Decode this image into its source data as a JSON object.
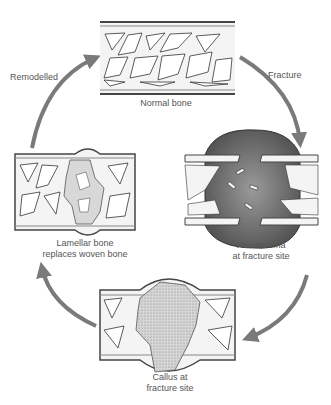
{
  "diagram": {
    "stages": [
      {
        "id": "normal",
        "label": "Normal bone"
      },
      {
        "id": "haematoma",
        "label_line1": "Haematoma",
        "label_line2": "at fracture site"
      },
      {
        "id": "callus",
        "label_line1": "Callus at",
        "label_line2": "fracture site"
      },
      {
        "id": "lamellar",
        "label_line1": "Lamellar bone",
        "label_line2": "replaces woven bone"
      }
    ],
    "arrows": [
      {
        "id": "fracture",
        "label": "Fracture",
        "from": "normal",
        "to": "haematoma"
      },
      {
        "id": "to-callus",
        "label": "",
        "from": "haematoma",
        "to": "callus"
      },
      {
        "id": "to-lamellar",
        "label": "",
        "from": "callus",
        "to": "lamellar"
      },
      {
        "id": "remodelled",
        "label": "Remodelled",
        "from": "lamellar",
        "to": "normal"
      }
    ],
    "colors": {
      "arrow": "#7a7a7a",
      "outline": "#333333",
      "bone_fill": "#f2f2f2",
      "haematoma": "#6e6e6e",
      "callus": "#cfcfcf",
      "woven": "#d8d8d8"
    }
  }
}
